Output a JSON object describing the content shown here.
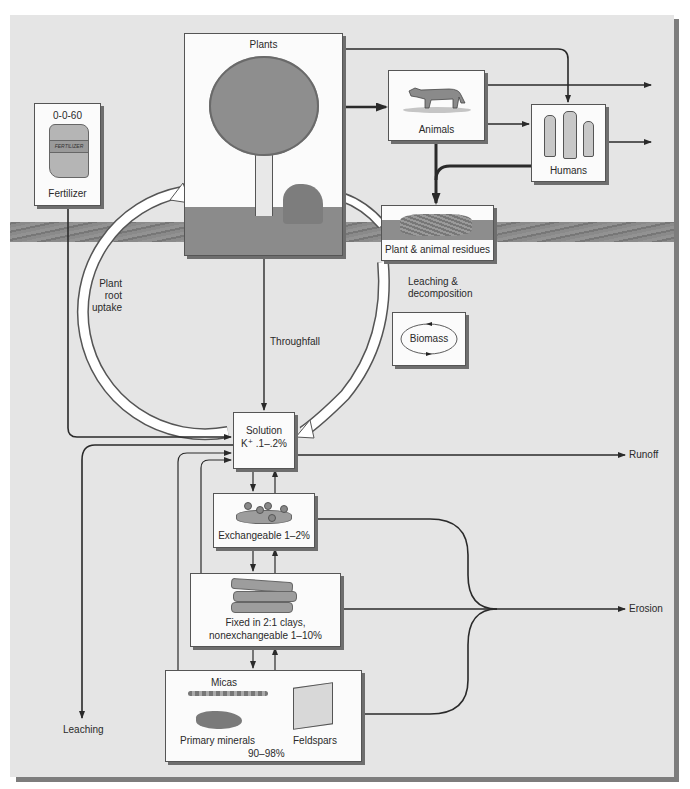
{
  "diagram": {
    "boxes": {
      "fertilizer": {
        "grade": "0-0-60",
        "label": "Fertilizer",
        "bag_text": "FERTILIZER"
      },
      "plants": {
        "label": "Plants"
      },
      "animals": {
        "label": "Animals"
      },
      "humans": {
        "label": "Humans"
      },
      "residues": {
        "label": "Plant & animal residues"
      },
      "biomass": {
        "label": "Biomass"
      },
      "solution": {
        "line1": "Solution",
        "line2": "K⁺ .1–.2%"
      },
      "exchangeable": {
        "label": "Exchangeable 1–2%"
      },
      "fixed": {
        "line1": "Fixed in 2:1 clays,",
        "line2": "nonexchangeable 1–10%"
      },
      "primary": {
        "micas": "Micas",
        "primary_minerals": "Primary minerals",
        "feldspars": "Feldspars",
        "percent": "90–98%"
      }
    },
    "flow_labels": {
      "plant_root_uptake": [
        "Plant",
        "root",
        "uptake"
      ],
      "throughfall": "Throughfall",
      "leaching_decomposition": [
        "Leaching &",
        "decomposition"
      ],
      "runoff": "Runoff",
      "erosion": "Erosion",
      "leaching": "Leaching"
    },
    "colors": {
      "panel": "#e5e5e5",
      "box": "#fbfbfb",
      "line": "#2a2a2a",
      "soil": "#858585",
      "shadow": "#6e6e6e",
      "cycle_arrow": "#ffffff"
    }
  }
}
